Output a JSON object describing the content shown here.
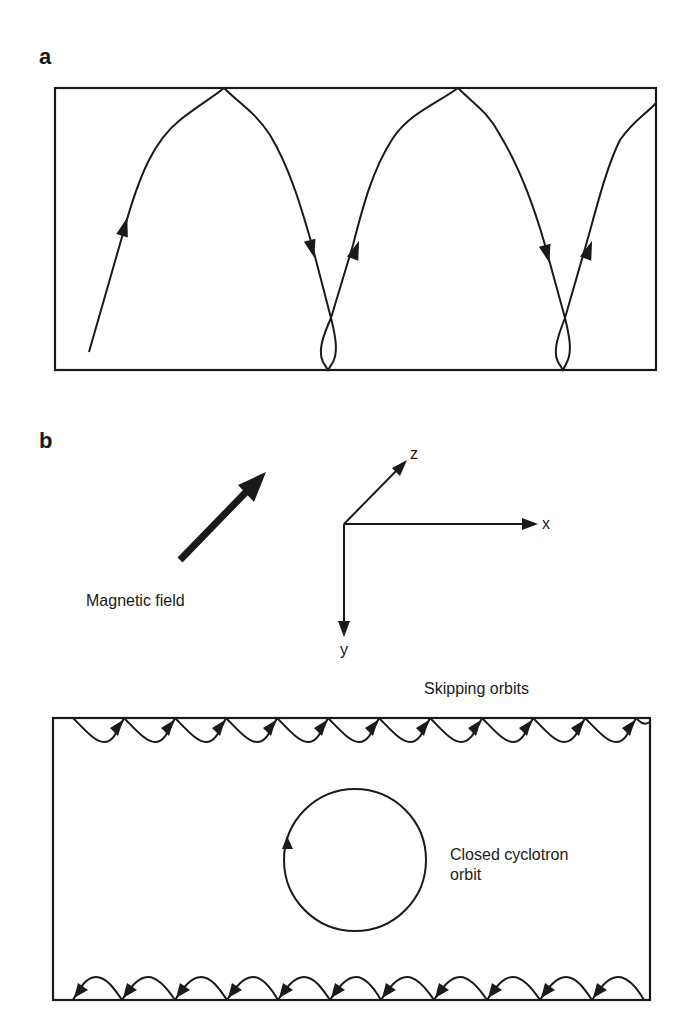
{
  "panels": {
    "a": {
      "label": "a",
      "box": {
        "x": 55,
        "y": 88,
        "width": 601,
        "height": 282
      },
      "trajectory_description": "Electron trajectory bouncing between top and bottom boundaries, reflecting specularly at top and forming small loops near the bottom edge"
    },
    "b": {
      "label": "b",
      "magnetic_field_label": "Magnetic field",
      "axes": {
        "x_label": "x",
        "y_label": "y",
        "z_label": "z"
      },
      "skipping_orbits_label": "Skipping orbits",
      "closed_orbit_label_line1": "Closed cyclotron",
      "closed_orbit_label_line2": "orbit",
      "box": {
        "x": 53,
        "y": 718,
        "width": 597,
        "height": 282
      },
      "top_hop_points_x": [
        73,
        124,
        175,
        226,
        277,
        328,
        379,
        430,
        482,
        533,
        585,
        636
      ],
      "bottom_hop_points_x": [
        73,
        122,
        175,
        227,
        278,
        330,
        381,
        434,
        487,
        540,
        592,
        644
      ],
      "circle": {
        "cx": 355,
        "cy": 860,
        "r": 71
      }
    }
  },
  "colors": {
    "line": "#1a1a1a",
    "background": "#ffffff"
  }
}
